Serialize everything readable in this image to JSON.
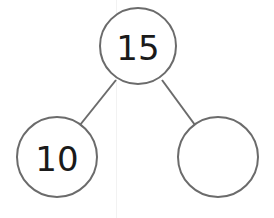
{
  "diagram": {
    "type": "number-bond",
    "whole": {
      "label": "15",
      "cx": 138,
      "cy": 46,
      "r": 38
    },
    "parts": [
      {
        "label": "10",
        "cx": 57,
        "cy": 157,
        "r": 40
      },
      {
        "label": "",
        "cx": 218,
        "cy": 157,
        "r": 40
      }
    ],
    "connectors": [
      {
        "x1": 116,
        "y1": 80,
        "x2": 80,
        "y2": 125
      },
      {
        "x1": 162,
        "y1": 80,
        "x2": 195,
        "y2": 125
      }
    ],
    "colors": {
      "stroke": "#6b6b6b",
      "text": "#1a1a1a",
      "background": "#ffffff"
    }
  }
}
